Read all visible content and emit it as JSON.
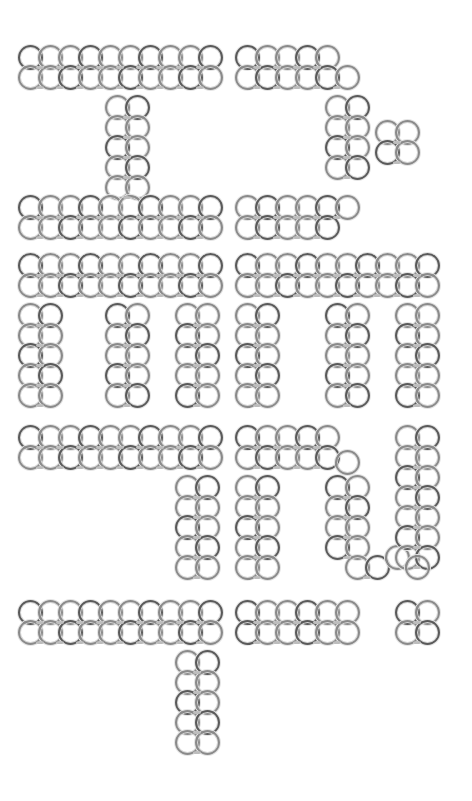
{
  "image": {
    "description": "Decorative Hangul-like glyphs drawn from interlocking ring (chainmail) patterns on white",
    "background": "#ffffff",
    "ring_color": "#8a8a8a",
    "ring_diameter": 25,
    "grid_step": 20
  },
  "glyphs": [
    {
      "name": "glyph-top-left",
      "rings": [
        [
          30,
          57
        ],
        [
          50,
          57
        ],
        [
          70,
          57
        ],
        [
          90,
          57
        ],
        [
          110,
          57
        ],
        [
          130,
          57
        ],
        [
          150,
          57
        ],
        [
          170,
          57
        ],
        [
          190,
          57
        ],
        [
          210,
          57
        ],
        [
          30,
          77
        ],
        [
          50,
          77
        ],
        [
          70,
          77
        ],
        [
          90,
          77
        ],
        [
          110,
          77
        ],
        [
          130,
          77
        ],
        [
          150,
          77
        ],
        [
          170,
          77
        ],
        [
          190,
          77
        ],
        [
          210,
          77
        ],
        [
          117,
          107
        ],
        [
          137,
          107
        ],
        [
          117,
          127
        ],
        [
          137,
          127
        ],
        [
          117,
          147
        ],
        [
          137,
          147
        ],
        [
          117,
          167
        ],
        [
          137,
          167
        ],
        [
          117,
          187
        ],
        [
          137,
          187
        ],
        [
          30,
          207
        ],
        [
          50,
          207
        ],
        [
          70,
          207
        ],
        [
          90,
          207
        ],
        [
          110,
          207
        ],
        [
          130,
          207
        ],
        [
          150,
          207
        ],
        [
          170,
          207
        ],
        [
          190,
          207
        ],
        [
          210,
          207
        ],
        [
          30,
          227
        ],
        [
          50,
          227
        ],
        [
          70,
          227
        ],
        [
          90,
          227
        ],
        [
          110,
          227
        ],
        [
          130,
          227
        ],
        [
          150,
          227
        ],
        [
          170,
          227
        ],
        [
          190,
          227
        ],
        [
          210,
          227
        ]
      ]
    },
    {
      "name": "glyph-top-right",
      "rings": [
        [
          247,
          57
        ],
        [
          267,
          57
        ],
        [
          287,
          57
        ],
        [
          307,
          57
        ],
        [
          327,
          57
        ],
        [
          247,
          77
        ],
        [
          267,
          77
        ],
        [
          287,
          77
        ],
        [
          307,
          77
        ],
        [
          327,
          77
        ],
        [
          347,
          77
        ],
        [
          337,
          107
        ],
        [
          357,
          107
        ],
        [
          337,
          127
        ],
        [
          357,
          127
        ],
        [
          337,
          147
        ],
        [
          357,
          147
        ],
        [
          337,
          167
        ],
        [
          357,
          167
        ],
        [
          387,
          132
        ],
        [
          407,
          132
        ],
        [
          387,
          152
        ],
        [
          407,
          152
        ],
        [
          247,
          207
        ],
        [
          267,
          207
        ],
        [
          287,
          207
        ],
        [
          307,
          207
        ],
        [
          327,
          207
        ],
        [
          347,
          207
        ],
        [
          247,
          227
        ],
        [
          267,
          227
        ],
        [
          287,
          227
        ],
        [
          307,
          227
        ],
        [
          327,
          227
        ]
      ]
    },
    {
      "name": "glyph-middle-left",
      "rings": [
        [
          30,
          265
        ],
        [
          50,
          265
        ],
        [
          70,
          265
        ],
        [
          90,
          265
        ],
        [
          110,
          265
        ],
        [
          130,
          265
        ],
        [
          150,
          265
        ],
        [
          170,
          265
        ],
        [
          190,
          265
        ],
        [
          210,
          265
        ],
        [
          30,
          285
        ],
        [
          50,
          285
        ],
        [
          70,
          285
        ],
        [
          90,
          285
        ],
        [
          110,
          285
        ],
        [
          130,
          285
        ],
        [
          150,
          285
        ],
        [
          170,
          285
        ],
        [
          190,
          285
        ],
        [
          210,
          285
        ],
        [
          30,
          315
        ],
        [
          50,
          315
        ],
        [
          30,
          335
        ],
        [
          50,
          335
        ],
        [
          30,
          355
        ],
        [
          50,
          355
        ],
        [
          30,
          375
        ],
        [
          50,
          375
        ],
        [
          30,
          395
        ],
        [
          50,
          395
        ],
        [
          117,
          315
        ],
        [
          137,
          315
        ],
        [
          117,
          335
        ],
        [
          137,
          335
        ],
        [
          117,
          355
        ],
        [
          137,
          355
        ],
        [
          117,
          375
        ],
        [
          137,
          375
        ],
        [
          117,
          395
        ],
        [
          137,
          395
        ],
        [
          187,
          315
        ],
        [
          207,
          315
        ],
        [
          187,
          335
        ],
        [
          207,
          335
        ],
        [
          187,
          355
        ],
        [
          207,
          355
        ],
        [
          187,
          375
        ],
        [
          207,
          375
        ],
        [
          187,
          395
        ],
        [
          207,
          395
        ]
      ]
    },
    {
      "name": "glyph-middle-right",
      "rings": [
        [
          247,
          265
        ],
        [
          267,
          265
        ],
        [
          287,
          265
        ],
        [
          307,
          265
        ],
        [
          327,
          265
        ],
        [
          347,
          265
        ],
        [
          367,
          265
        ],
        [
          387,
          265
        ],
        [
          407,
          265
        ],
        [
          427,
          265
        ],
        [
          247,
          285
        ],
        [
          267,
          285
        ],
        [
          287,
          285
        ],
        [
          307,
          285
        ],
        [
          327,
          285
        ],
        [
          347,
          285
        ],
        [
          367,
          285
        ],
        [
          387,
          285
        ],
        [
          407,
          285
        ],
        [
          427,
          285
        ],
        [
          247,
          315
        ],
        [
          267,
          315
        ],
        [
          247,
          335
        ],
        [
          267,
          335
        ],
        [
          247,
          355
        ],
        [
          267,
          355
        ],
        [
          247,
          375
        ],
        [
          267,
          375
        ],
        [
          247,
          395
        ],
        [
          267,
          395
        ],
        [
          337,
          315
        ],
        [
          357,
          315
        ],
        [
          337,
          335
        ],
        [
          357,
          335
        ],
        [
          337,
          355
        ],
        [
          357,
          355
        ],
        [
          337,
          375
        ],
        [
          357,
          375
        ],
        [
          337,
          395
        ],
        [
          357,
          395
        ],
        [
          407,
          315
        ],
        [
          427,
          315
        ],
        [
          407,
          335
        ],
        [
          427,
          335
        ],
        [
          407,
          355
        ],
        [
          427,
          355
        ],
        [
          407,
          375
        ],
        [
          427,
          375
        ],
        [
          407,
          395
        ],
        [
          427,
          395
        ]
      ]
    },
    {
      "name": "glyph-lower-left",
      "rings": [
        [
          30,
          437
        ],
        [
          50,
          437
        ],
        [
          70,
          437
        ],
        [
          90,
          437
        ],
        [
          110,
          437
        ],
        [
          130,
          437
        ],
        [
          150,
          437
        ],
        [
          170,
          437
        ],
        [
          190,
          437
        ],
        [
          210,
          437
        ],
        [
          30,
          457
        ],
        [
          50,
          457
        ],
        [
          70,
          457
        ],
        [
          90,
          457
        ],
        [
          110,
          457
        ],
        [
          130,
          457
        ],
        [
          150,
          457
        ],
        [
          170,
          457
        ],
        [
          190,
          457
        ],
        [
          210,
          457
        ],
        [
          187,
          487
        ],
        [
          207,
          487
        ],
        [
          187,
          507
        ],
        [
          207,
          507
        ],
        [
          187,
          527
        ],
        [
          207,
          527
        ],
        [
          187,
          547
        ],
        [
          207,
          547
        ],
        [
          187,
          567
        ],
        [
          207,
          567
        ]
      ]
    },
    {
      "name": "glyph-lower-right",
      "rings": [
        [
          247,
          437
        ],
        [
          267,
          437
        ],
        [
          287,
          437
        ],
        [
          307,
          437
        ],
        [
          327,
          437
        ],
        [
          247,
          457
        ],
        [
          267,
          457
        ],
        [
          287,
          457
        ],
        [
          307,
          457
        ],
        [
          327,
          457
        ],
        [
          347,
          462
        ],
        [
          247,
          487
        ],
        [
          267,
          487
        ],
        [
          247,
          507
        ],
        [
          267,
          507
        ],
        [
          247,
          527
        ],
        [
          267,
          527
        ],
        [
          247,
          547
        ],
        [
          267,
          547
        ],
        [
          247,
          567
        ],
        [
          267,
          567
        ],
        [
          337,
          487
        ],
        [
          357,
          487
        ],
        [
          337,
          507
        ],
        [
          357,
          507
        ],
        [
          337,
          527
        ],
        [
          357,
          527
        ],
        [
          337,
          547
        ],
        [
          357,
          547
        ],
        [
          357,
          567
        ],
        [
          377,
          567
        ],
        [
          397,
          557
        ],
        [
          407,
          437
        ],
        [
          427,
          437
        ],
        [
          407,
          457
        ],
        [
          427,
          457
        ],
        [
          407,
          477
        ],
        [
          427,
          477
        ],
        [
          407,
          497
        ],
        [
          427,
          497
        ],
        [
          407,
          517
        ],
        [
          427,
          517
        ],
        [
          407,
          537
        ],
        [
          427,
          537
        ],
        [
          407,
          557
        ],
        [
          427,
          557
        ],
        [
          417,
          567
        ]
      ]
    },
    {
      "name": "glyph-bottom-left",
      "rings": [
        [
          30,
          612
        ],
        [
          50,
          612
        ],
        [
          70,
          612
        ],
        [
          90,
          612
        ],
        [
          110,
          612
        ],
        [
          130,
          612
        ],
        [
          150,
          612
        ],
        [
          170,
          612
        ],
        [
          190,
          612
        ],
        [
          210,
          612
        ],
        [
          30,
          632
        ],
        [
          50,
          632
        ],
        [
          70,
          632
        ],
        [
          90,
          632
        ],
        [
          110,
          632
        ],
        [
          130,
          632
        ],
        [
          150,
          632
        ],
        [
          170,
          632
        ],
        [
          190,
          632
        ],
        [
          210,
          632
        ],
        [
          187,
          662
        ],
        [
          207,
          662
        ],
        [
          187,
          682
        ],
        [
          207,
          682
        ],
        [
          187,
          702
        ],
        [
          207,
          702
        ],
        [
          187,
          722
        ],
        [
          207,
          722
        ],
        [
          187,
          742
        ],
        [
          207,
          742
        ]
      ]
    },
    {
      "name": "glyph-bottom-middle",
      "rings": [
        [
          247,
          612
        ],
        [
          267,
          612
        ],
        [
          287,
          612
        ],
        [
          307,
          612
        ],
        [
          327,
          612
        ],
        [
          347,
          612
        ],
        [
          247,
          632
        ],
        [
          267,
          632
        ],
        [
          287,
          632
        ],
        [
          307,
          632
        ],
        [
          327,
          632
        ],
        [
          347,
          632
        ]
      ]
    },
    {
      "name": "glyph-bottom-dot",
      "rings": [
        [
          407,
          612
        ],
        [
          427,
          612
        ],
        [
          407,
          632
        ],
        [
          427,
          632
        ]
      ]
    }
  ]
}
